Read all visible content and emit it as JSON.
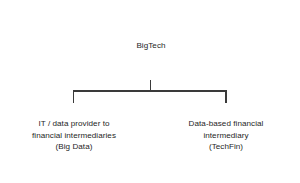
{
  "diagram": {
    "type": "hierarchy-tree",
    "background_color": "#ffffff",
    "line_color": "#3a3a3a",
    "text_color": "#262626",
    "box_fill": "#ffffff",
    "nodes": {
      "parent": {
        "id": "bigtech",
        "label": "BigTech",
        "level": 1
      },
      "child_left": {
        "id": "big-data",
        "label": "IT / data provider to\nfinancial intermediaries\n(Big Data)",
        "line1": "IT / data provider to",
        "line2": "financial intermediaries",
        "line3": "(Big Data)",
        "level": 2
      },
      "child_right": {
        "id": "techfin",
        "label": "Data-based financial\nintermediary\n(TechFin)",
        "line1": "Data-based financial",
        "line2": "intermediary",
        "line3": "(TechFin)",
        "level": 2
      }
    },
    "edges": [
      {
        "from": "bigtech",
        "to": "big-data"
      },
      {
        "from": "bigtech",
        "to": "techfin"
      }
    ]
  }
}
